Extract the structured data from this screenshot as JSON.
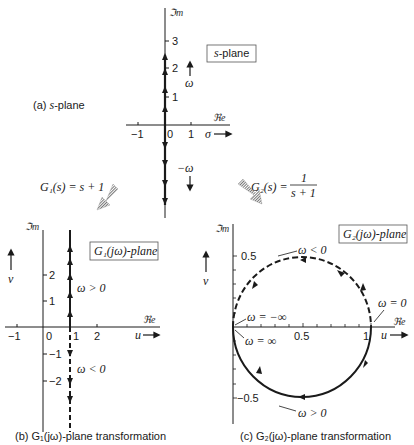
{
  "panels": {
    "a": {
      "caption_prefix": "(a)",
      "caption_var": "s",
      "caption_suffix": "-plane",
      "box_var": "s",
      "box_suffix": "-plane",
      "axis_im": "ℑm",
      "axis_re": "ℜe",
      "x_ticks": [
        "−1",
        "0",
        "1"
      ],
      "y_ticks": [
        "3",
        "2",
        "1"
      ],
      "x_var": "σ",
      "pos_freq": "ω",
      "neg_freq": "−ω"
    },
    "b": {
      "caption": "(b) G₁(jω)-plane transformation",
      "box": "G₁(jω)-plane",
      "axis_im": "ℑm",
      "axis_re": "ℜe",
      "x_ticks": [
        "−1",
        "0",
        "1",
        "2"
      ],
      "y_ticks": [
        "2",
        "1",
        "−1",
        "−2"
      ],
      "x_var": "u",
      "y_var": "v",
      "label_pos": "ω > 0",
      "label_neg": "ω < 0"
    },
    "c": {
      "caption": "(c) G₂(jω)-plane transformation",
      "box": "G₂(jω)-plane",
      "axis_im": "ℑm",
      "axis_re": "ℜe",
      "x_ticks": [
        "0.5",
        "1"
      ],
      "y_ticks": [
        "0.5",
        "−0.5"
      ],
      "x_var": "u",
      "y_var": "v",
      "label_neg": "ω < 0",
      "label_pos": "ω > 0",
      "label_zero": "ω = 0",
      "label_neg_inf": "ω = −∞",
      "label_pos_inf": "ω = ∞"
    }
  },
  "mappings": {
    "g1": {
      "lhs": "G₁(s) = s + 1"
    },
    "g2": {
      "lhs": "G₂(s) =",
      "num": "1",
      "den": "s + 1"
    }
  }
}
